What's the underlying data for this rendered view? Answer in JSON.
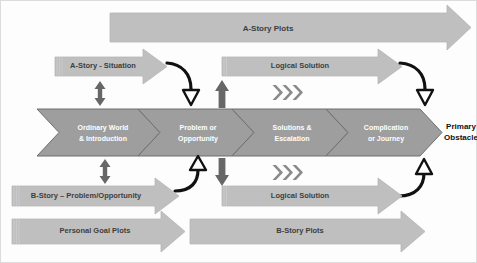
{
  "diagram": {
    "colors": {
      "background": "#fdfdfd",
      "arrow_fill": "#bfbfbf",
      "arrow_stroke": "#b2b2b2",
      "band_fill": "#9e9e9e",
      "band_stroke": "#6f6f6f",
      "solid_marker": "#676767",
      "curve_stroke": "#111111",
      "label_dark": "#3d3d3d",
      "label_white": "#ffffff",
      "label_black": "#111111",
      "frame_stroke": "#d9d9d9"
    },
    "top_band": {
      "plots_arrow": {
        "label": "A-Story Plots"
      },
      "situation_arrow": {
        "label": "A-Story - Situation"
      },
      "logical_arrow": {
        "label": "Logical Solution"
      }
    },
    "center_band": {
      "stages": [
        {
          "line1": "Ordinary World",
          "line2": "& Introduction"
        },
        {
          "line1": "Problem or",
          "line2": "Opportunity"
        },
        {
          "line1": "Solutions &",
          "line2": "Escalation"
        },
        {
          "line1": "Complication",
          "line2": "or Journey"
        }
      ],
      "end_label": {
        "line1": "Primary",
        "line2": "Obstacle"
      }
    },
    "bottom_band": {
      "bstory_problem_arrow": {
        "label": "B-Story – Problem/Opportunity"
      },
      "logical_arrow": {
        "label": "Logical Solution"
      },
      "personal_goal_arrow": {
        "label": "Personal Goal Plots"
      },
      "bstory_plots_arrow": {
        "label": "B-Story Plots"
      }
    },
    "markers": {
      "double_headed_top": "double-headed-vertical-arrow",
      "double_headed_bottom": "double-headed-vertical-arrow",
      "solid_up": "solid-up-arrow",
      "solid_down": "solid-down-arrow",
      "curve_down_left": "curved-arrow-down",
      "curve_down_right": "curved-arrow-down",
      "curve_up_left": "curved-arrow-up",
      "curve_up_right": "curved-arrow-up",
      "chevrons_top": "triple-chevron-right",
      "chevrons_bottom": "triple-chevron-right"
    }
  }
}
